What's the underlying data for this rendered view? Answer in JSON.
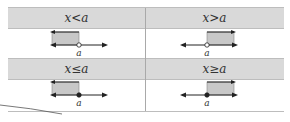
{
  "table": {
    "rows": [
      {
        "cells": [
          {
            "label": "x<a",
            "point_label": "a",
            "dot": "open",
            "direction": "left"
          },
          {
            "label": "x>a",
            "point_label": "a",
            "dot": "open",
            "direction": "right"
          }
        ]
      },
      {
        "cells": [
          {
            "label": "x≤a",
            "point_label": "a",
            "dot": "closed",
            "direction": "left"
          },
          {
            "label": "x≥a",
            "point_label": "a",
            "dot": "closed",
            "direction": "right"
          }
        ]
      }
    ]
  },
  "colors": {
    "header_bg": "#d9d9d9",
    "shade": "#c8c8c8",
    "line": "#222222",
    "border": "#bdbdbd"
  }
}
